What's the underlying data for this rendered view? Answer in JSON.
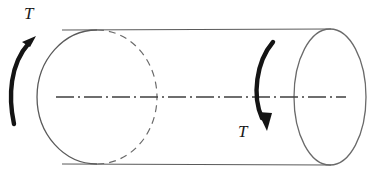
{
  "figure": {
    "background_color": "#ffffff",
    "stroke_color": "#5a5a5a",
    "arrow_color": "#141414",
    "text_color": "#1a1a1a",
    "width": 374,
    "height": 175
  },
  "labels": {
    "torque_left": "T",
    "torque_right": "T"
  },
  "geometry": {
    "left_ellipse": {
      "cx": 97,
      "cy": 97,
      "rx": 60,
      "ry": 67
    },
    "right_ellipse": {
      "cx": 330,
      "cy": 97,
      "rx": 36,
      "ry": 68
    },
    "top_edge": {
      "x1": 62,
      "y1": 30,
      "x2": 330,
      "y2": 29
    },
    "bottom_edge": {
      "x1": 62,
      "y1": 164,
      "x2": 330,
      "y2": 165
    },
    "centerline": {
      "x1": 56,
      "y1": 97,
      "x2": 346,
      "y2": 97
    }
  },
  "elements": {
    "left_arrow_name": "torque-arrow-left-ccw",
    "right_arrow_name": "torque-arrow-right-cw",
    "centerline_name": "axis-centerline",
    "left_face_name": "left-end-face-ellipse",
    "right_face_name": "right-end-face-ellipse",
    "hidden_edge_name": "hidden-edge-dashed-arc"
  }
}
